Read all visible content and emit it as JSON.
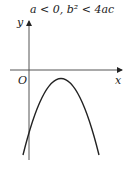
{
  "title": "a < 0, b² < 4ac",
  "axes": {
    "x_label": "x",
    "y_label": "y",
    "origin_label": "O"
  },
  "curve": {
    "type": "parabola",
    "opens": "down",
    "description": "downward-opening parabola entirely below the x-axis, vertex right of the y-axis",
    "color": "#222222"
  },
  "colors": {
    "axis": "#555555",
    "curve": "#222222",
    "text": "#222222"
  }
}
